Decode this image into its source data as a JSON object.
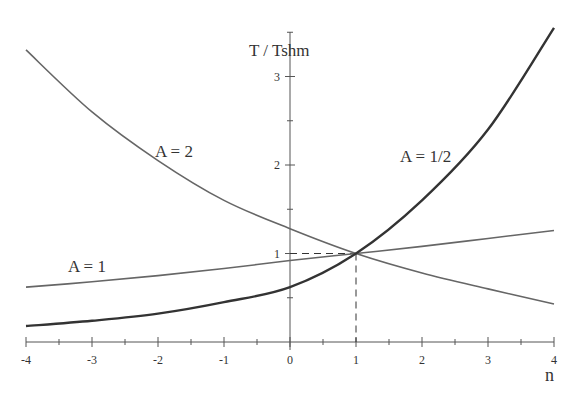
{
  "header_fragment": "(continued) ... = 1)",
  "chart_data": {
    "type": "line",
    "title": "",
    "xlabel": "n",
    "ylabel": "T / Tshm",
    "xlim": [
      -4,
      4
    ],
    "ylim": [
      0,
      3.5
    ],
    "x_ticks": [
      "-4",
      "-3",
      "-2",
      "-1",
      "0",
      "1",
      "2",
      "3",
      "4"
    ],
    "y_ticks": [
      "1",
      "2",
      "3"
    ],
    "grid": false,
    "reference_point": {
      "x": 1,
      "y": 1,
      "style": "dashed guide lines"
    },
    "series": [
      {
        "name": "A = 2",
        "x": [
          -4,
          -3,
          -2,
          -1,
          0,
          1,
          2,
          3,
          4
        ],
        "values": [
          3.3,
          2.6,
          2.05,
          1.6,
          1.28,
          1.0,
          0.78,
          0.6,
          0.43
        ]
      },
      {
        "name": "A = 1",
        "x": [
          -4,
          -3,
          -2,
          -1,
          0,
          1,
          2,
          3,
          4
        ],
        "values": [
          0.62,
          0.68,
          0.75,
          0.83,
          0.92,
          1.0,
          1.08,
          1.17,
          1.26
        ]
      },
      {
        "name": "A = 1/2",
        "x": [
          -4,
          -3,
          -2,
          -1,
          0,
          1,
          2,
          3,
          4
        ],
        "values": [
          0.18,
          0.24,
          0.32,
          0.45,
          0.62,
          1.0,
          1.6,
          2.4,
          3.55
        ]
      }
    ]
  },
  "labels": {
    "a2": "A = 2",
    "a1": "A = 1",
    "ahalf": "A = 1/2",
    "ylabel": "T / Tshm",
    "xlabel": "n"
  }
}
